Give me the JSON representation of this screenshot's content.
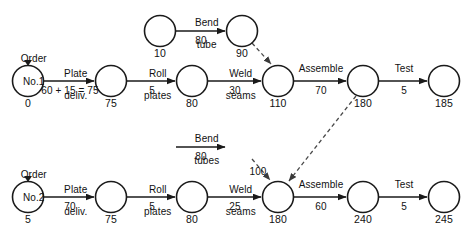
{
  "diagram": {
    "type": "activity-on-arrow network",
    "colors": {
      "stroke": "#1a1a1a",
      "dashed": "#4a4a4a",
      "background": "#ffffff"
    },
    "nodes": [
      {
        "id": "n1_start",
        "value": "0",
        "cx": 28,
        "cy": 81,
        "r": 15.5
      },
      {
        "id": "n1_75",
        "value": "75",
        "cx": 111,
        "cy": 81,
        "r": 15.5
      },
      {
        "id": "n1_80",
        "value": "80",
        "cx": 192,
        "cy": 81,
        "r": 15.5
      },
      {
        "id": "n1_110",
        "value": "110",
        "cx": 278,
        "cy": 81,
        "r": 15.5
      },
      {
        "id": "n1_180",
        "value": "180",
        "cx": 363,
        "cy": 81,
        "r": 15.5
      },
      {
        "id": "n1_185",
        "value": "185",
        "cx": 444,
        "cy": 81,
        "r": 15.5
      },
      {
        "id": "n1_10",
        "value": "10",
        "cx": 160,
        "cy": 31,
        "r": 15.5
      },
      {
        "id": "n1_90",
        "value": "90",
        "cx": 242,
        "cy": 31,
        "r": 15.5
      },
      {
        "id": "n2_start",
        "value": "5",
        "cx": 28,
        "cy": 197,
        "r": 15.5
      },
      {
        "id": "n2_75",
        "value": "75",
        "cx": 111,
        "cy": 197,
        "r": 15.5
      },
      {
        "id": "n2_80",
        "value": "80",
        "cx": 192,
        "cy": 197,
        "r": 15.5
      },
      {
        "id": "n2_180",
        "value": "180",
        "cx": 278,
        "cy": 197,
        "r": 15.5
      },
      {
        "id": "n2_240",
        "value": "240",
        "cx": 363,
        "cy": 197,
        "r": 15.5
      },
      {
        "id": "n2_245",
        "value": "245",
        "cx": 444,
        "cy": 197,
        "r": 15.5
      }
    ],
    "orders": [
      {
        "id": "order1",
        "line1": "Order",
        "line2": "No.1",
        "x": 28,
        "y": 41
      },
      {
        "id": "order2",
        "line1": "Order",
        "line2": "No.2",
        "x": 28,
        "y": 157
      }
    ],
    "activities": [
      {
        "id": "a_plate1",
        "name_line1": "Plate",
        "name_line2": "deliv.",
        "duration": "60 + 15 = 75",
        "label_x": 70,
        "name_y": 57,
        "dur_y": 85
      },
      {
        "id": "a_roll1",
        "name_line1": "Roll",
        "name_line2": "plates",
        "duration": "5",
        "label_x": 152,
        "name_y": 57,
        "dur_y": 85
      },
      {
        "id": "a_weld1",
        "name_line1": "Weld",
        "name_line2": "seams",
        "duration": "30",
        "label_x": 235,
        "name_y": 57,
        "dur_y": 85
      },
      {
        "id": "a_asm1",
        "name_line1": "Assemble",
        "name_line2": "",
        "duration": "70",
        "label_x": 321,
        "name_y": 63,
        "dur_y": 85
      },
      {
        "id": "a_test1",
        "name_line1": "Test",
        "name_line2": "",
        "duration": "5",
        "label_x": 404,
        "name_y": 63,
        "dur_y": 85
      },
      {
        "id": "a_bend1",
        "name_line1": "Bend",
        "name_line2": "tube",
        "duration": "80",
        "label_x": 201,
        "name_y": 6,
        "dur_y": 35
      },
      {
        "id": "a_plate2",
        "name_line1": "Plate",
        "name_line2": "deliv.",
        "duration": "70",
        "label_x": 70,
        "name_y": 173,
        "dur_y": 201
      },
      {
        "id": "a_roll2",
        "name_line1": "Roll",
        "name_line2": "plates",
        "duration": "5",
        "label_x": 152,
        "name_y": 173,
        "dur_y": 201
      },
      {
        "id": "a_weld2",
        "name_line1": "Weld",
        "name_line2": "seams",
        "duration": "25",
        "label_x": 235,
        "name_y": 173,
        "dur_y": 201
      },
      {
        "id": "a_asm2",
        "name_line1": "Assemble",
        "name_line2": "",
        "duration": "60",
        "label_x": 321,
        "name_y": 179,
        "dur_y": 201
      },
      {
        "id": "a_test2",
        "name_line1": "Test",
        "name_line2": "",
        "duration": "5",
        "label_x": 404,
        "name_y": 179,
        "dur_y": 201
      },
      {
        "id": "a_bend2",
        "name_line1": "Bend",
        "name_line2": "tubes",
        "duration": "80",
        "label_x": 201,
        "name_y": 122,
        "dur_y": 151
      }
    ],
    "dashed_labels": [
      {
        "id": "dash_100",
        "text": "100",
        "x": 258,
        "y": 166
      }
    ]
  }
}
